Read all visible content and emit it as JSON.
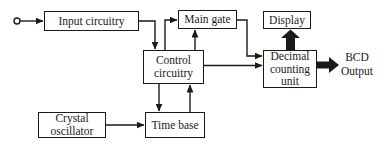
{
  "diagram": {
    "type": "block-diagram",
    "colors": {
      "background": "#ffffff",
      "line": "#1a1a1a",
      "box_fill": "#ffffff",
      "text": "#1a1a1a",
      "thick_arrow_fill": "#1a1a1a"
    },
    "blocks": {
      "input_circuitry": {
        "label": "Input circuitry"
      },
      "main_gate": {
        "label": "Main gate"
      },
      "display": {
        "label": "Display"
      },
      "control_circuitry": {
        "label": "Control circuitry"
      },
      "decimal_counting_unit": {
        "label": "Decimal counting unit"
      },
      "crystal_oscillator": {
        "label": "Crystal oscillator"
      },
      "time_base": {
        "label": "Time base"
      }
    },
    "labels": {
      "bcd_output": "BCD Output"
    },
    "terminals": [
      {
        "id": "signal_input_terminal",
        "shape": "open-circle"
      }
    ],
    "connections": [
      {
        "from": "signal_input_terminal",
        "to": "input_circuitry",
        "style": "thin-arrow"
      },
      {
        "from": "input_circuitry",
        "to": "control_circuitry",
        "style": "thin-arrow"
      },
      {
        "from": "control_circuitry",
        "to": "main_gate",
        "style": "thin-arrow",
        "entry": "left"
      },
      {
        "from": "control_circuitry",
        "to": "main_gate",
        "style": "thin-arrow",
        "entry": "bottom"
      },
      {
        "from": "main_gate",
        "to": "decimal_counting_unit",
        "style": "thin-arrow"
      },
      {
        "from": "control_circuitry",
        "to": "decimal_counting_unit",
        "style": "thin-arrow"
      },
      {
        "from": "control_circuitry",
        "to": "time_base",
        "style": "thin-arrow"
      },
      {
        "from": "time_base",
        "to": "control_circuitry",
        "style": "thin-arrow"
      },
      {
        "from": "crystal_oscillator",
        "to": "time_base",
        "style": "thin-arrow"
      },
      {
        "from": "decimal_counting_unit",
        "to": "display",
        "style": "thick-arrow"
      },
      {
        "from": "decimal_counting_unit",
        "to": "bcd_output",
        "style": "thick-arrow"
      }
    ]
  }
}
